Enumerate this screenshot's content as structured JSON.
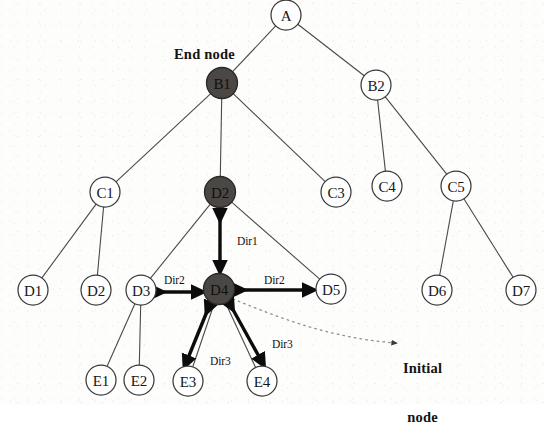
{
  "diagram": {
    "background_color": "#fdfdfc",
    "line_color": "#4a4a4a",
    "highlight_node_color": "#4a4744",
    "arrow_color": "#0c0c0c",
    "dotted_pointer_color": "#8d8d8d",
    "nodes": [
      {
        "id": "A",
        "label": "A",
        "x": 286,
        "y": 15,
        "r": 15,
        "style": "open"
      },
      {
        "id": "B1",
        "label": "B1",
        "x": 222,
        "y": 83,
        "r": 15.5,
        "style": "filled"
      },
      {
        "id": "B2",
        "label": "B2",
        "x": 376,
        "y": 85,
        "r": 15,
        "style": "open"
      },
      {
        "id": "C1",
        "label": "C1",
        "x": 105,
        "y": 192,
        "r": 15,
        "style": "open"
      },
      {
        "id": "D2top",
        "label": "D2",
        "x": 220,
        "y": 192,
        "r": 15.5,
        "style": "filled"
      },
      {
        "id": "C3",
        "label": "C3",
        "x": 336,
        "y": 192,
        "r": 15,
        "style": "open"
      },
      {
        "id": "C4",
        "label": "C4",
        "x": 387,
        "y": 186,
        "r": 15,
        "style": "open"
      },
      {
        "id": "C5",
        "label": "C5",
        "x": 456,
        "y": 186,
        "r": 15,
        "style": "open"
      },
      {
        "id": "D1",
        "label": "D1",
        "x": 33,
        "y": 290,
        "r": 15,
        "style": "open"
      },
      {
        "id": "D2",
        "label": "D2",
        "x": 96,
        "y": 290,
        "r": 15,
        "style": "open"
      },
      {
        "id": "D3",
        "label": "D3",
        "x": 141,
        "y": 290,
        "r": 15,
        "style": "open"
      },
      {
        "id": "D4",
        "label": "D4",
        "x": 219,
        "y": 289,
        "r": 15.5,
        "style": "filled"
      },
      {
        "id": "D5",
        "label": "D5",
        "x": 331,
        "y": 289,
        "r": 15,
        "style": "open"
      },
      {
        "id": "D6",
        "label": "D6",
        "x": 437,
        "y": 290,
        "r": 15,
        "style": "open"
      },
      {
        "id": "D7",
        "label": "D7",
        "x": 521,
        "y": 290,
        "r": 15,
        "style": "open"
      },
      {
        "id": "E1",
        "label": "E1",
        "x": 101,
        "y": 380,
        "r": 15,
        "style": "open"
      },
      {
        "id": "E2",
        "label": "E2",
        "x": 139,
        "y": 380,
        "r": 15,
        "style": "open"
      },
      {
        "id": "E3",
        "label": "E3",
        "x": 188,
        "y": 381,
        "r": 15,
        "style": "open"
      },
      {
        "id": "E4",
        "label": "E4",
        "x": 262,
        "y": 381,
        "r": 15,
        "style": "open"
      }
    ],
    "edges": [
      {
        "from": "A",
        "to": "B1"
      },
      {
        "from": "A",
        "to": "B2"
      },
      {
        "from": "B1",
        "to": "C1"
      },
      {
        "from": "B1",
        "to": "D2top"
      },
      {
        "from": "B1",
        "to": "C3"
      },
      {
        "from": "B2",
        "to": "C4"
      },
      {
        "from": "B2",
        "to": "C5"
      },
      {
        "from": "C1",
        "to": "D1"
      },
      {
        "from": "C1",
        "to": "D2"
      },
      {
        "from": "D2top",
        "to": "D3"
      },
      {
        "from": "D2top",
        "to": "D4"
      },
      {
        "from": "D2top",
        "to": "D5"
      },
      {
        "from": "C5",
        "to": "D6"
      },
      {
        "from": "C5",
        "to": "D7"
      },
      {
        "from": "D3",
        "to": "E1"
      },
      {
        "from": "D3",
        "to": "E2"
      },
      {
        "from": "D4",
        "to": "E3"
      },
      {
        "from": "D4",
        "to": "E4"
      }
    ],
    "direction_arrows": [
      {
        "id": "dir1",
        "label": "Dir1",
        "between": [
          "D2top",
          "D4"
        ],
        "orientation": "vertical",
        "label_x": 237,
        "label_y": 235
      },
      {
        "id": "dir2a",
        "label": "Dir2",
        "between": [
          "D3",
          "D4"
        ],
        "orientation": "horizontal",
        "label_x": 164,
        "label_y": 274
      },
      {
        "id": "dir2b",
        "label": "Dir2",
        "between": [
          "D4",
          "D5"
        ],
        "orientation": "horizontal",
        "label_x": 264,
        "label_y": 274
      },
      {
        "id": "dir3a",
        "label": "Dir3",
        "between": [
          "D4",
          "E3"
        ],
        "orientation": "diagonal",
        "label_x": 210,
        "label_y": 355
      },
      {
        "id": "dir3b",
        "label": "Dir3",
        "between": [
          "D4",
          "E4"
        ],
        "orientation": "diagonal",
        "label_x": 272,
        "label_y": 338
      }
    ],
    "annotations": [
      {
        "id": "end-node",
        "text": "End node",
        "x": 174,
        "y": 54,
        "points_to": "B1"
      },
      {
        "id": "initial-node",
        "text_line1": "Initial",
        "text_line2": "node",
        "x": 403,
        "y": 335,
        "points_to": "D4"
      }
    ]
  }
}
